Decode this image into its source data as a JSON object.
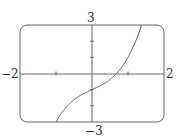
{
  "chart_data": {
    "type": "line",
    "title": "",
    "xlabel": "",
    "ylabel": "",
    "xlim": [
      -2,
      2
    ],
    "ylim": [
      -3,
      3
    ],
    "grid": false,
    "legend": null,
    "x_ticks": [
      -1,
      1
    ],
    "y_ticks": [
      -2,
      -1,
      1,
      2
    ],
    "labels": {
      "x_min": "−2",
      "x_max": "2",
      "y_max": "3",
      "y_min": "−3"
    },
    "series": [
      {
        "name": "f(x)",
        "expression": "x^3 + x - 1",
        "x": [
          -0.97,
          -0.8,
          -0.6,
          -0.4,
          -0.2,
          0,
          0.2,
          0.4,
          0.6,
          0.68,
          0.8,
          1.0,
          1.2,
          1.36
        ],
        "y": [
          -2.88,
          -2.31,
          -1.82,
          -1.46,
          -1.21,
          -1.0,
          -0.79,
          -0.54,
          -0.18,
          0.0,
          0.31,
          1.0,
          1.93,
          2.88
        ]
      }
    ],
    "frame": "rounded-rectangle viewing window"
  },
  "colors": {
    "frame": "#555555",
    "axis": "#555555",
    "curve": "#555555",
    "text": "#333333"
  }
}
